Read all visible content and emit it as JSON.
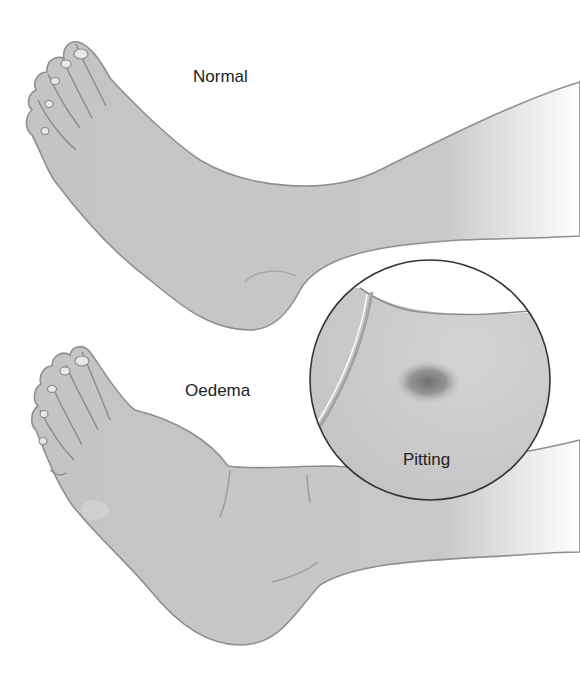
{
  "figure": {
    "labels": {
      "normal": "Normal",
      "oedema": "Oedema",
      "pitting": "Pitting"
    },
    "colors": {
      "skin": "#c4c4c4",
      "skin_light": "#d6d6d6",
      "outline": "#8a8a8a",
      "inset_border": "#333333",
      "pit": "#7a7a7a",
      "background": "#ffffff"
    }
  }
}
